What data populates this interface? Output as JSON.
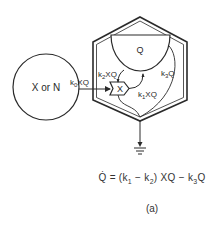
{
  "diagram": {
    "source_node": {
      "label": "X or N"
    },
    "pool_node": {
      "label": "Q"
    },
    "converter_node": {
      "label": "X"
    },
    "flows": {
      "k0": {
        "coef": "k",
        "sub": "0",
        "term": "XQ"
      },
      "k1": {
        "coef": "k",
        "sub": "1",
        "term": "XQ"
      },
      "k2": {
        "coef": "k",
        "sub": "2",
        "term": "XQ"
      },
      "k3": {
        "coef": "k",
        "sub": "3",
        "term": "Q"
      }
    },
    "equation": {
      "lhs": "Q̇",
      "eq1": " = (",
      "k1": "k",
      "k1_sub": "1",
      "minus1": " − ",
      "k2": "k",
      "k2_sub": "2",
      "mid": ") XQ − ",
      "k3": "k",
      "k3_sub": "3",
      "tail": "Q"
    },
    "caption": "(a)",
    "colors": {
      "stroke": "#2a2a2a",
      "background": "#ffffff"
    }
  }
}
